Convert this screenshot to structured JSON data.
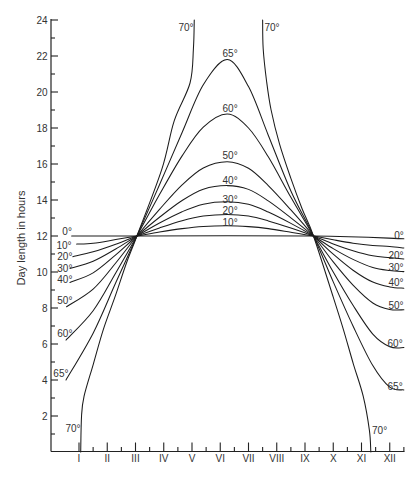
{
  "chart_data": {
    "type": "line",
    "title": "",
    "xlabel": "",
    "ylabel": "Day length in hours",
    "xlim": [
      0,
      12.5
    ],
    "ylim": [
      0,
      24
    ],
    "grid": false,
    "legend_position": "none",
    "x_ticks": [
      1,
      2,
      3,
      4,
      5,
      6,
      7,
      8,
      9,
      10,
      11,
      12
    ],
    "x_tick_labels": [
      "I",
      "II",
      "III",
      "IV",
      "V",
      "VI",
      "VII",
      "VIII",
      "IX",
      "X",
      "XI",
      "XII"
    ],
    "x_minor_ticks": [
      1.5,
      2.5,
      3.5,
      4.5,
      5.5,
      6.5,
      7.5,
      8.5,
      9.5,
      10.5,
      11.5,
      12.5
    ],
    "y_ticks": [
      2,
      4,
      6,
      8,
      10,
      12,
      14,
      16,
      18,
      20,
      22,
      24
    ],
    "y_tick_labels": [
      "2",
      "4",
      "6",
      "8",
      "10",
      "12",
      "14",
      "16",
      "18",
      "20",
      "22",
      "24"
    ],
    "y_minor_ticks": [
      1,
      3,
      5,
      7,
      9,
      11,
      13,
      15,
      17,
      19,
      21,
      23
    ],
    "series": [
      {
        "name": "0°",
        "latitude": 0,
        "segments": [
          [
            [
              0.74,
              12.0
            ],
            [
              3.05,
              12.0
            ],
            [
              9.3,
              12.0
            ],
            [
              12.5,
              11.85
            ]
          ]
        ]
      },
      {
        "name": "10°",
        "latitude": 10,
        "segments": [
          [
            [
              0.92,
              11.55
            ],
            [
              1.5,
              11.6
            ],
            [
              2.3,
              11.8
            ],
            [
              3.05,
              12.0
            ],
            [
              3.85,
              12.22
            ],
            [
              4.65,
              12.41
            ],
            [
              5.4,
              12.53
            ],
            [
              6.25,
              12.57
            ],
            [
              7.0,
              12.52
            ],
            [
              7.7,
              12.41
            ],
            [
              8.5,
              12.21
            ],
            [
              9.3,
              12.0
            ],
            [
              10.0,
              11.79
            ],
            [
              10.7,
              11.6
            ],
            [
              11.4,
              11.47
            ],
            [
              12.0,
              11.42
            ],
            [
              12.5,
              11.33
            ]
          ]
        ]
      },
      {
        "name": "20°",
        "latitude": 20,
        "segments": [
          [
            [
              0.78,
              10.85
            ],
            [
              1.5,
              11.12
            ],
            [
              2.3,
              11.54
            ],
            [
              3.05,
              12.0
            ],
            [
              3.85,
              12.45
            ],
            [
              4.65,
              12.85
            ],
            [
              5.4,
              13.11
            ],
            [
              6.25,
              13.2
            ],
            [
              7.0,
              13.11
            ],
            [
              7.7,
              12.84
            ],
            [
              8.5,
              12.44
            ],
            [
              9.3,
              12.0
            ],
            [
              10.0,
              11.56
            ],
            [
              10.7,
              11.18
            ],
            [
              11.4,
              10.9
            ],
            [
              12.0,
              10.8
            ],
            [
              12.5,
              10.72
            ]
          ]
        ]
      },
      {
        "name": "30°",
        "latitude": 30,
        "segments": [
          [
            [
              0.68,
              10.2
            ],
            [
              1.5,
              10.6
            ],
            [
              2.3,
              11.28
            ],
            [
              3.05,
              12.0
            ],
            [
              3.85,
              12.72
            ],
            [
              4.65,
              13.35
            ],
            [
              5.4,
              13.77
            ],
            [
              6.25,
              13.9
            ],
            [
              7.0,
              13.76
            ],
            [
              7.7,
              13.33
            ],
            [
              8.5,
              12.7
            ],
            [
              9.3,
              12.0
            ],
            [
              10.0,
              11.3
            ],
            [
              10.7,
              10.7
            ],
            [
              11.4,
              10.25
            ],
            [
              12.0,
              10.08
            ],
            [
              12.5,
              10.02
            ]
          ]
        ]
      },
      {
        "name": "40°",
        "latitude": 40,
        "segments": [
          [
            [
              0.68,
              9.42
            ],
            [
              1.5,
              9.95
            ],
            [
              2.3,
              10.95
            ],
            [
              3.05,
              12.0
            ],
            [
              3.85,
              13.04
            ],
            [
              4.65,
              13.97
            ],
            [
              5.4,
              14.6
            ],
            [
              6.25,
              14.8
            ],
            [
              7.0,
              14.59
            ],
            [
              7.7,
              13.95
            ],
            [
              8.5,
              13.01
            ],
            [
              9.3,
              12.0
            ],
            [
              10.0,
              10.99
            ],
            [
              10.7,
              10.1
            ],
            [
              11.4,
              9.44
            ],
            [
              12.0,
              9.17
            ],
            [
              12.5,
              9.1
            ]
          ]
        ]
      },
      {
        "name": "50°",
        "latitude": 50,
        "segments": [
          [
            [
              0.56,
              8.07
            ],
            [
              1.5,
              9.05
            ],
            [
              2.3,
              10.5
            ],
            [
              3.05,
              12.0
            ],
            [
              3.85,
              13.48
            ],
            [
              4.65,
              14.84
            ],
            [
              5.4,
              15.78
            ],
            [
              6.25,
              16.13
            ],
            [
              7.0,
              15.76
            ],
            [
              7.7,
              14.8
            ],
            [
              8.5,
              13.45
            ],
            [
              9.3,
              12.0
            ],
            [
              10.0,
              10.56
            ],
            [
              10.7,
              9.27
            ],
            [
              11.4,
              8.28
            ],
            [
              12.0,
              7.92
            ],
            [
              12.5,
              7.9
            ]
          ]
        ]
      },
      {
        "name": "60°",
        "latitude": 60,
        "segments": [
          [
            [
              0.54,
              6.22
            ],
            [
              1.5,
              7.85
            ],
            [
              2.3,
              9.95
            ],
            [
              3.05,
              12.0
            ],
            [
              3.85,
              14.3
            ],
            [
              4.65,
              16.45
            ],
            [
              5.4,
              18.05
            ],
            [
              6.25,
              18.78
            ],
            [
              7.0,
              18.0
            ],
            [
              7.7,
              16.4
            ],
            [
              8.5,
              14.15
            ],
            [
              9.3,
              12.0
            ],
            [
              10.0,
              10.0
            ],
            [
              10.7,
              8.15
            ],
            [
              11.4,
              6.55
            ],
            [
              12.0,
              5.85
            ],
            [
              12.5,
              5.8
            ]
          ]
        ]
      },
      {
        "name": "65°",
        "latitude": 65,
        "segments": [
          [
            [
              0.54,
              4.0
            ],
            [
              1.5,
              6.6
            ],
            [
              2.3,
              9.4
            ],
            [
              3.05,
              12.0
            ],
            [
              3.85,
              14.85
            ],
            [
              4.65,
              17.75
            ],
            [
              5.4,
              20.4
            ],
            [
              6.25,
              21.8
            ],
            [
              7.0,
              20.3
            ],
            [
              7.7,
              17.6
            ],
            [
              8.5,
              14.5
            ],
            [
              9.3,
              12.0
            ],
            [
              10.0,
              9.45
            ],
            [
              10.7,
              7.0
            ],
            [
              11.4,
              4.8
            ],
            [
              12.0,
              3.6
            ],
            [
              12.5,
              3.45
            ]
          ]
        ]
      },
      {
        "name": "70°",
        "latitude": 70,
        "segments": [
          [
            [
              1.06,
              0.0
            ],
            [
              1.09,
              2.0
            ],
            [
              1.18,
              3.1
            ],
            [
              1.51,
              4.9
            ],
            [
              1.86,
              6.8
            ],
            [
              2.27,
              8.6
            ],
            [
              2.68,
              10.5
            ],
            [
              3.05,
              12.0
            ],
            [
              3.93,
              15.7
            ],
            [
              4.37,
              18.4
            ],
            [
              4.93,
              20.5
            ],
            [
              5.05,
              22.4
            ],
            [
              5.08,
              24.0
            ]
          ],
          [
            [
              7.5,
              24.0
            ],
            [
              7.52,
              22.4
            ],
            [
              7.64,
              20.6
            ],
            [
              7.8,
              19.0
            ],
            [
              8.1,
              17.1
            ],
            [
              8.5,
              15.2
            ],
            [
              8.9,
              13.5
            ],
            [
              9.3,
              12.0
            ],
            [
              10.0,
              8.6
            ],
            [
              10.36,
              6.8
            ],
            [
              10.71,
              4.9
            ],
            [
              11.06,
              3.1
            ],
            [
              11.28,
              1.2
            ],
            [
              11.33,
              0.0
            ]
          ]
        ]
      }
    ],
    "annotations": [
      {
        "text": "0°",
        "x": 0.58,
        "y": 12.25,
        "side": "left"
      },
      {
        "text": "10°",
        "x": 0.47,
        "y": 11.47,
        "side": "left"
      },
      {
        "text": "20°",
        "x": 0.5,
        "y": 10.86,
        "side": "left"
      },
      {
        "text": "30°",
        "x": 0.5,
        "y": 10.22,
        "side": "left"
      },
      {
        "text": "40°",
        "x": 0.5,
        "y": 9.58,
        "side": "left"
      },
      {
        "text": "50°",
        "x": 0.5,
        "y": 8.42,
        "side": "left"
      },
      {
        "text": "60°",
        "x": 0.5,
        "y": 6.58,
        "side": "left"
      },
      {
        "text": "65°",
        "x": 0.36,
        "y": 4.39,
        "side": "left"
      },
      {
        "text": "70°",
        "x": 0.79,
        "y": 1.33,
        "side": "left"
      },
      {
        "text": "70°",
        "x": 4.79,
        "y": 23.58,
        "side": "top"
      },
      {
        "text": "70°",
        "x": 7.83,
        "y": 23.58,
        "side": "top"
      },
      {
        "text": "65°",
        "x": 6.35,
        "y": 22.14,
        "side": "top"
      },
      {
        "text": "60°",
        "x": 6.35,
        "y": 19.08,
        "side": "top"
      },
      {
        "text": "50°",
        "x": 6.35,
        "y": 16.47,
        "side": "top"
      },
      {
        "text": "40°",
        "x": 6.35,
        "y": 15.08,
        "side": "top"
      },
      {
        "text": "30°",
        "x": 6.35,
        "y": 14.03,
        "side": "top"
      },
      {
        "text": "20°",
        "x": 6.35,
        "y": 13.42,
        "side": "top"
      },
      {
        "text": "10°",
        "x": 6.35,
        "y": 12.75,
        "side": "top"
      },
      {
        "text": "0°",
        "x": 12.33,
        "y": 12.06,
        "side": "right"
      },
      {
        "text": "20°",
        "x": 12.22,
        "y": 10.91,
        "side": "right"
      },
      {
        "text": "30°",
        "x": 12.22,
        "y": 10.26,
        "side": "right"
      },
      {
        "text": "40°",
        "x": 12.22,
        "y": 9.43,
        "side": "right"
      },
      {
        "text": "50°",
        "x": 12.22,
        "y": 8.17,
        "side": "right"
      },
      {
        "text": "60°",
        "x": 12.19,
        "y": 6.03,
        "side": "right"
      },
      {
        "text": "65°",
        "x": 12.19,
        "y": 3.64,
        "side": "right"
      },
      {
        "text": "70°",
        "x": 11.64,
        "y": 1.19,
        "side": "right"
      }
    ]
  }
}
